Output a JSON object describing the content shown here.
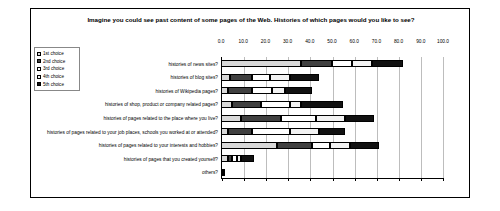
{
  "figure": {
    "title": "Imagine you could see past content of some pages of the Web. Histories of which pages would you like to see?"
  },
  "legend": {
    "items": [
      {
        "label": "1st choice",
        "color": "#d9d9d9"
      },
      {
        "label": "2nd choice",
        "color": "#404040"
      },
      {
        "label": "3rd choice",
        "color": "#ffffff"
      },
      {
        "label": "4th choice",
        "color": "#f2f2f2"
      },
      {
        "label": "5th choice",
        "color": "#111111"
      }
    ]
  },
  "chart_data": {
    "type": "bar",
    "orientation": "horizontal",
    "stacked": true,
    "title": "Imagine you could see past content of some pages of the Web. Histories of which pages would you like to see?",
    "xlabel": "",
    "ylabel": "",
    "xlim": [
      0,
      100
    ],
    "xticks": [
      "0.0",
      "10.0",
      "20.0",
      "30.0",
      "40.0",
      "50.0",
      "60.0",
      "70.0",
      "80.0",
      "90.0",
      "100.0"
    ],
    "grid": true,
    "legend_position": "top-left",
    "categories": [
      "histories of news sites?",
      "histories of blog sites?",
      "histories of Wikipedia pages?",
      "histories of shop, product or company related pages?",
      "histories of pages related to the place where you live?",
      "histories of pages related to your job places, schools you worked at or attended?",
      "histories of pages related to your interests and hobbies?",
      "histories of pages that you created yourself?",
      "others?"
    ],
    "series": [
      {
        "name": "1st choice",
        "color": "#d9d9d9",
        "values": [
          36,
          4,
          3,
          5,
          9,
          3,
          25,
          3,
          1
        ]
      },
      {
        "name": "2nd choice",
        "color": "#404040",
        "values": [
          14,
          10,
          11,
          13,
          18,
          11,
          16,
          2,
          0
        ]
      },
      {
        "name": "3rd choice",
        "color": "#ffffff",
        "values": [
          9,
          8,
          9,
          13,
          16,
          17,
          8,
          2,
          0
        ]
      },
      {
        "name": "4th choice",
        "color": "#f2f2f2",
        "values": [
          9,
          9,
          6,
          5,
          13,
          13,
          9,
          2,
          0
        ]
      },
      {
        "name": "5th choice",
        "color": "#111111",
        "values": [
          14,
          13,
          12,
          19,
          13,
          12,
          13,
          6,
          1
        ]
      }
    ]
  }
}
